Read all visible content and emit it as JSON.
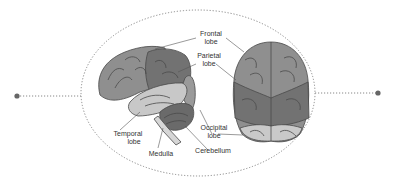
{
  "diagram": {
    "type": "labeled-anatomy",
    "views": [
      "lateral-side-view",
      "top-view"
    ],
    "labels": {
      "frontal": {
        "line1": "Frontal",
        "line2": "lobe"
      },
      "parietal": {
        "line1": "Parietal",
        "line2": "lobe"
      },
      "occipital": {
        "line1": "Occipital",
        "line2": "lobe"
      },
      "cerebellum": {
        "line1": "Cerebellum"
      },
      "temporal": {
        "line1": "Temporal",
        "line2": "lobe"
      },
      "medulla": {
        "line1": "Medulla"
      }
    },
    "colors": {
      "frontal": "#8f8f8f",
      "parietal": "#727272",
      "occipital": "#9a9a9a",
      "temporal": "#c8c8c8",
      "cerebellum": "#6a6a6a",
      "occipital_top": "#c9c9c9",
      "outline": "#4a4a4a",
      "dotted": "#777777"
    }
  }
}
